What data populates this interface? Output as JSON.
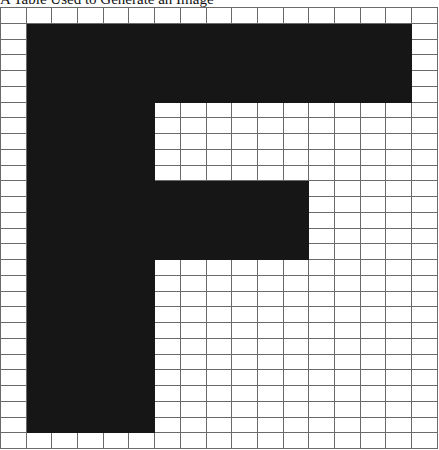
{
  "caption": "A Table Used to Generate an Image",
  "grid": {
    "columns": 17,
    "rows": 28,
    "filled_color": "#161616",
    "empty_color": "#ffffff",
    "line_color": "#6a6a6a",
    "filled_ranges": [
      {
        "rows": [
          1,
          5
        ],
        "cols": [
          1,
          15
        ]
      },
      {
        "rows": [
          6,
          10
        ],
        "cols": [
          1,
          5
        ]
      },
      {
        "rows": [
          11,
          15
        ],
        "cols": [
          1,
          11
        ]
      },
      {
        "rows": [
          16,
          26
        ],
        "cols": [
          1,
          5
        ]
      }
    ],
    "depicts": "letter F"
  }
}
